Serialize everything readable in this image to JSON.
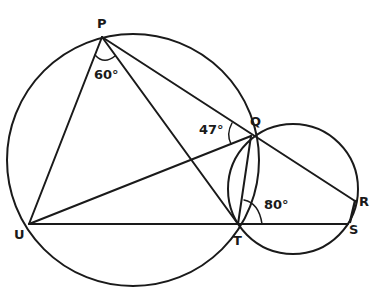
{
  "diagram": {
    "type": "geometry-two-intersecting-circles",
    "stroke_color": "#1a1a1a",
    "points": {
      "P": {
        "label": "P",
        "x": 102,
        "y": 37
      },
      "Q": {
        "label": "Q",
        "x": 251,
        "y": 136
      },
      "R": {
        "label": "R",
        "x": 355,
        "y": 201
      },
      "S": {
        "label": "S",
        "x": 348,
        "y": 224
      },
      "T": {
        "label": "T",
        "x": 238,
        "y": 224
      },
      "U": {
        "label": "U",
        "x": 29,
        "y": 224
      }
    },
    "circles": [
      {
        "name": "large-circle",
        "cx": 133,
        "cy": 160,
        "r": 126,
        "through": [
          "P",
          "Q",
          "T",
          "U"
        ]
      },
      {
        "name": "small-circle",
        "cx": 293,
        "cy": 189,
        "r": 65,
        "through": [
          "Q",
          "R",
          "S",
          "T"
        ]
      }
    ],
    "segments": [
      [
        "P",
        "U"
      ],
      [
        "P",
        "T"
      ],
      [
        "P",
        "Q"
      ],
      [
        "Q",
        "R"
      ],
      [
        "U",
        "Q"
      ],
      [
        "U",
        "S"
      ],
      [
        "Q",
        "T"
      ]
    ],
    "angles": [
      {
        "name": "angle-UPT",
        "vertex": "P",
        "label": "60°"
      },
      {
        "name": "angle-PQU",
        "vertex": "Q",
        "label": "47°"
      },
      {
        "name": "angle-QTS",
        "vertex": "T",
        "label": "80°"
      }
    ]
  }
}
